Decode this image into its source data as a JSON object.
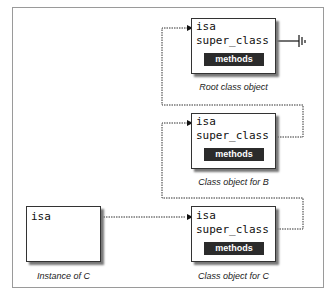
{
  "diagram": {
    "root": {
      "isa": "isa",
      "super_class": "super_class",
      "methods": "methods",
      "caption": "Root class object"
    },
    "class_b": {
      "isa": "isa",
      "super_class": "super_class",
      "methods": "methods",
      "caption": "Class object for B"
    },
    "class_c": {
      "isa": "isa",
      "super_class": "super_class",
      "methods": "methods",
      "caption": "Class object for C"
    },
    "instance": {
      "isa": "isa",
      "caption": "Instance of C"
    }
  }
}
